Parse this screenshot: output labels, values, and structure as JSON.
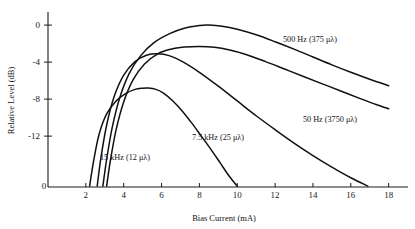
{
  "chart_data": {
    "type": "line",
    "title": "",
    "xlabel": "Bias Current (mA)",
    "ylabel": "Relative Level (dB)",
    "xlim": [
      0,
      18.6
    ],
    "ylim": [
      -17.5,
      1.2
    ],
    "grid": false,
    "legend_position": "inline-annotations",
    "xticks": [
      0,
      2,
      4,
      6,
      8,
      10,
      12,
      14,
      16,
      18
    ],
    "xticklabels": [
      "0",
      "2",
      "4",
      "6",
      "8",
      "10",
      "12",
      "14",
      "16",
      "18"
    ],
    "yticks": [
      0,
      -4,
      -8,
      -12
    ],
    "yticklabels": [
      "0",
      "-4",
      "-8",
      "-12"
    ],
    "series": [
      {
        "name": "500 Hz (375 μλ)",
        "label": "500 Hz (375 μλ)",
        "peak_x": 8.5,
        "peak_y": 0,
        "x": [
          2.9,
          3.1,
          3.4,
          3.8,
          4.3,
          4.9,
          5.6,
          6.4,
          7.2,
          8.0,
          8.5,
          9.2,
          10.0,
          11.0,
          12.0,
          13.0,
          14.0,
          15.0,
          16.0,
          17.0,
          18.0
        ],
        "y": [
          -17.4,
          -14.5,
          -11.0,
          -7.8,
          -5.2,
          -3.3,
          -1.9,
          -0.95,
          -0.35,
          -0.05,
          0.0,
          -0.12,
          -0.45,
          -1.05,
          -1.8,
          -2.6,
          -3.45,
          -4.3,
          -5.1,
          -5.85,
          -6.55
        ]
      },
      {
        "name": "50 Hz (3750 μλ)",
        "label": "50 Hz (3750 μλ)",
        "peak_x": 8.0,
        "peak_y": -2.3,
        "x": [
          3.1,
          3.3,
          3.6,
          4.0,
          4.5,
          5.1,
          5.8,
          6.5,
          7.2,
          8.0,
          8.8,
          9.6,
          10.5,
          11.5,
          12.5,
          13.5,
          14.5,
          15.5,
          16.5,
          17.3,
          18.0
        ],
        "y": [
          -17.4,
          -14.6,
          -11.3,
          -8.3,
          -5.9,
          -4.2,
          -3.1,
          -2.6,
          -2.38,
          -2.3,
          -2.4,
          -2.7,
          -3.2,
          -3.95,
          -4.75,
          -5.55,
          -6.35,
          -7.15,
          -7.95,
          -8.55,
          -9.05
        ]
      },
      {
        "name": "7.5 kHz (25 μλ)",
        "label": "7.5 kHz (25 μλ)",
        "peak_x": 5.8,
        "peak_y": -3.1,
        "x": [
          2.6,
          2.8,
          3.1,
          3.5,
          4.0,
          4.6,
          5.2,
          5.8,
          6.4,
          7.2,
          8.0,
          9.0,
          10.0,
          11.0,
          12.0,
          13.0,
          14.0,
          15.0,
          16.0,
          16.9
        ],
        "y": [
          -17.4,
          -14.3,
          -10.8,
          -7.7,
          -5.4,
          -3.95,
          -3.25,
          -3.1,
          -3.3,
          -4.05,
          -5.1,
          -6.6,
          -8.2,
          -9.8,
          -11.3,
          -12.75,
          -14.1,
          -15.35,
          -16.5,
          -17.4
        ]
      },
      {
        "name": "15 kHz (12 μλ)",
        "label": "15 kHz (12 μλ)",
        "peak_x": 5.3,
        "peak_y": -6.8,
        "x": [
          2.2,
          2.4,
          2.7,
          3.1,
          3.6,
          4.1,
          4.6,
          5.0,
          5.3,
          5.7,
          6.1,
          6.6,
          7.1,
          7.6,
          8.1,
          8.6,
          9.1,
          9.6,
          10.0
        ],
        "y": [
          -17.4,
          -14.8,
          -11.8,
          -9.6,
          -8.2,
          -7.4,
          -6.95,
          -6.82,
          -6.8,
          -6.95,
          -7.35,
          -8.2,
          -9.3,
          -10.6,
          -12.0,
          -13.4,
          -14.9,
          -16.4,
          -17.4
        ]
      }
    ],
    "annotations": [
      {
        "text": "500 Hz (375 μλ)",
        "x_px": 310,
        "y_px": 42
      },
      {
        "text": "50 Hz (3750 μλ)",
        "x_px": 330,
        "y_px": 122
      },
      {
        "text": "7.5 kHz (25 μλ)",
        "x_px": 218,
        "y_px": 140
      },
      {
        "text": "15 kHz (12 μλ)",
        "x_px": 125,
        "y_px": 160
      }
    ]
  },
  "axes": {
    "x_title": "Bias Current (mA)",
    "y_title": "Relative Level (dB)",
    "x_tick_labels": [
      "0",
      "2",
      "4",
      "6",
      "8",
      "10",
      "12",
      "14",
      "16",
      "18"
    ],
    "y_tick_labels": [
      "0",
      "-4",
      "-8",
      "-12"
    ],
    "origin_label": "0"
  },
  "labels": {
    "s500": "500 Hz (375 μλ)",
    "s50": "50 Hz (3750 μλ)",
    "s75k": "7.5 kHz (25 μλ)",
    "s15k": "15 kHz (12 μλ)"
  },
  "colors": {
    "curve": "#111111",
    "axis": "#1a1a1a",
    "background": "#ffffff"
  }
}
